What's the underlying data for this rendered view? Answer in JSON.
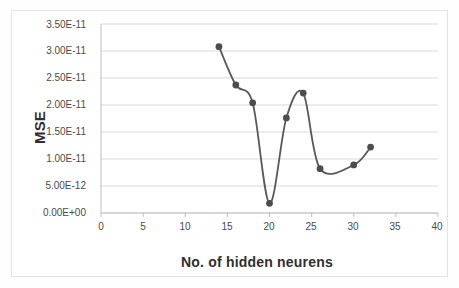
{
  "chart_data": {
    "type": "line",
    "title": "",
    "xlabel": "No. of hidden neurens",
    "ylabel": "MSE",
    "x": [
      14,
      16,
      18,
      20,
      22,
      24,
      26,
      30,
      32
    ],
    "values": [
      3.08e-11,
      2.37e-11,
      2.04e-11,
      1.8e-12,
      1.76e-11,
      2.22e-11,
      8.2e-12,
      8.9e-12,
      1.22e-11
    ],
    "series": [
      {
        "name": "MSE",
        "x": [
          14,
          16,
          18,
          20,
          22,
          24,
          26,
          30,
          32
        ],
        "values": [
          3.08e-11,
          2.37e-11,
          2.04e-11,
          1.8e-12,
          1.76e-11,
          2.22e-11,
          8.2e-12,
          8.9e-12,
          1.22e-11
        ]
      }
    ],
    "xlim": [
      0,
      40
    ],
    "ylim": [
      0,
      3.5e-11
    ],
    "xticks": [
      0,
      5,
      10,
      15,
      20,
      25,
      30,
      35,
      40
    ],
    "xtick_labels": [
      "0",
      "5",
      "10",
      "15",
      "20",
      "25",
      "30",
      "35",
      "40"
    ],
    "yticks": [
      0,
      5e-12,
      1e-11,
      1.5e-11,
      2e-11,
      2.5e-11,
      3e-11,
      3.5e-11
    ],
    "ytick_labels": [
      "0.00E+00",
      "5.00E-12",
      "1.00E-11",
      "1.50E-11",
      "2.00E-11",
      "2.50E-11",
      "3.00E-11",
      "3.50E-11"
    ],
    "grid": "horizontal",
    "legend": "none",
    "smoothing": true,
    "marker": "circle",
    "line_color": "#595959",
    "marker_color": "#4d4d4d",
    "grid_color": "#d9d9d9",
    "axis_color": "#bfbfbf",
    "plot_background": "#ffffff"
  }
}
